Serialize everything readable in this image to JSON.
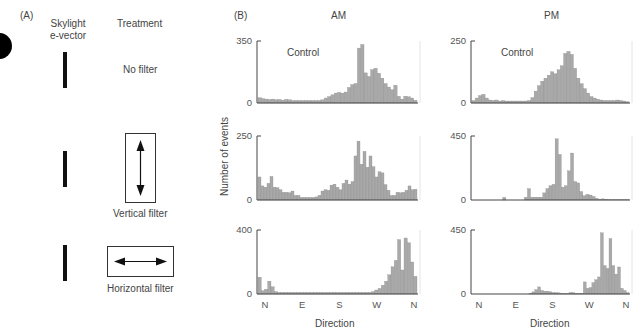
{
  "panel_a": {
    "label": "(A)",
    "col_evector": "Skylight\ne-vector",
    "col_evector_l1": "Skylight",
    "col_evector_l2": "e-vector",
    "col_treatment": "Treatment",
    "rows": [
      {
        "treatment": "No filter"
      },
      {
        "treatment": "Vertical filter"
      },
      {
        "treatment": "Horizontal filter"
      }
    ]
  },
  "panel_b": {
    "label": "(B)",
    "col_am": "AM",
    "col_pm": "PM",
    "ylabel": "Number of events",
    "xlabel": "Direction",
    "control_label": "Control"
  },
  "chart_data": [
    {
      "type": "bar",
      "title": "AM - No filter (Control)",
      "xlabel": "Direction",
      "ylabel": "Number of events",
      "ylim": [
        0,
        350
      ],
      "xticks": [
        "N",
        "E",
        "S",
        "W",
        "N"
      ],
      "values": [
        30,
        25,
        22,
        20,
        22,
        18,
        20,
        16,
        20,
        18,
        14,
        14,
        14,
        14,
        14,
        14,
        14,
        14,
        14,
        18,
        28,
        36,
        46,
        56,
        60,
        56,
        62,
        88,
        104,
        110,
        310,
        330,
        170,
        150,
        188,
        196,
        168,
        140,
        110,
        90,
        75,
        100,
        38,
        22,
        38,
        35,
        28,
        15
      ]
    },
    {
      "type": "bar",
      "title": "PM - No filter (Control)",
      "xlabel": "Direction",
      "ylabel": "Number of events",
      "ylim": [
        0,
        250
      ],
      "xticks": [
        "N",
        "E",
        "S",
        "W",
        "N"
      ],
      "values": [
        10,
        20,
        30,
        35,
        20,
        12,
        10,
        12,
        8,
        10,
        8,
        8,
        8,
        8,
        8,
        8,
        8,
        10,
        22,
        48,
        70,
        88,
        100,
        112,
        126,
        118,
        134,
        150,
        200,
        208,
        196,
        140,
        100,
        78,
        58,
        40,
        26,
        20,
        15,
        12,
        10,
        10,
        10,
        10,
        12,
        10,
        8,
        5
      ]
    },
    {
      "type": "bar",
      "title": "AM - Vertical filter",
      "xlabel": "Direction",
      "ylabel": "Number of events",
      "ylim": [
        0,
        250
      ],
      "xticks": [
        "N",
        "E",
        "S",
        "W",
        "N"
      ],
      "values": [
        90,
        55,
        50,
        65,
        92,
        50,
        48,
        40,
        30,
        30,
        28,
        35,
        18,
        18,
        10,
        10,
        10,
        10,
        10,
        12,
        18,
        35,
        40,
        38,
        58,
        62,
        50,
        40,
        65,
        78,
        62,
        72,
        172,
        230,
        140,
        190,
        128,
        172,
        130,
        90,
        110,
        106,
        60,
        38,
        18,
        18,
        30,
        28,
        30,
        38,
        55,
        40,
        42
      ]
    },
    {
      "type": "bar",
      "title": "PM - Vertical filter",
      "xlabel": "Direction",
      "ylabel": "Number of events",
      "ylim": [
        0,
        450
      ],
      "xticks": [
        "N",
        "E",
        "S",
        "W",
        "N"
      ],
      "values": [
        0,
        0,
        0,
        0,
        0,
        0,
        0,
        0,
        0,
        0,
        18,
        0,
        0,
        0,
        0,
        0,
        0,
        20,
        80,
        20,
        20,
        20,
        20,
        50,
        80,
        100,
        110,
        430,
        320,
        90,
        100,
        205,
        330,
        130,
        120,
        60,
        30,
        40,
        35,
        25,
        12,
        5,
        8,
        5,
        3,
        2,
        2,
        2,
        2,
        2,
        2
      ]
    },
    {
      "type": "bar",
      "title": "AM - Horizontal filter",
      "xlabel": "Direction",
      "ylabel": "Number of events",
      "ylim": [
        0,
        400
      ],
      "xticks": [
        "N",
        "E",
        "S",
        "W",
        "N"
      ],
      "values": [
        105,
        20,
        30,
        80,
        45,
        15,
        10,
        10,
        10,
        10,
        10,
        10,
        10,
        10,
        10,
        10,
        10,
        10,
        10,
        10,
        10,
        10,
        10,
        10,
        10,
        10,
        10,
        10,
        10,
        10,
        10,
        10,
        10,
        10,
        10,
        15,
        25,
        35,
        55,
        80,
        120,
        170,
        210,
        340,
        150,
        350,
        320,
        200,
        110
      ]
    },
    {
      "type": "bar",
      "title": "PM - Horizontal filter",
      "xlabel": "Direction",
      "ylabel": "Number of events",
      "ylim": [
        0,
        450
      ],
      "xticks": [
        "N",
        "E",
        "S",
        "W",
        "N"
      ],
      "values": [
        0,
        0,
        0,
        0,
        0,
        0,
        0,
        0,
        0,
        0,
        0,
        0,
        0,
        0,
        0,
        0,
        0,
        0,
        0,
        0,
        5,
        15,
        30,
        50,
        25,
        20,
        20,
        15,
        10,
        10,
        8,
        5,
        5,
        5,
        10,
        10,
        5,
        5,
        5,
        85,
        40,
        45,
        80,
        100,
        120,
        430,
        200,
        180,
        390,
        200,
        140,
        190,
        40,
        25,
        10
      ]
    }
  ]
}
